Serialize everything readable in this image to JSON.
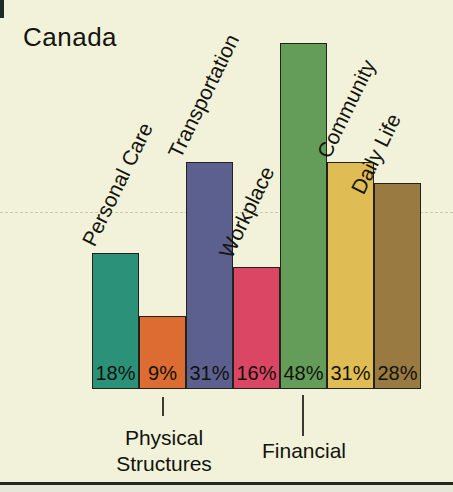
{
  "title": "Canada",
  "chart_data": {
    "type": "bar",
    "title": "Canada",
    "unit": "%",
    "categories": [
      "Personal Care",
      "Physical Structures",
      "Transportation",
      "Workplace",
      "Financial",
      "Community",
      "Daily Life"
    ],
    "values": [
      18,
      9,
      31,
      16,
      48,
      31,
      28
    ],
    "value_labels": [
      "18%",
      "9%",
      "31%",
      "16%",
      "48%",
      "31%",
      "28%"
    ],
    "colors": [
      "#2b9179",
      "#dc6c31",
      "#5b608f",
      "#da4663",
      "#649c59",
      "#e0bc55",
      "#997b41"
    ],
    "outline_color": "#22221c",
    "background_color": "#f1f2d9",
    "label_placement": [
      "rotated",
      "below",
      "rotated",
      "rotated",
      "below",
      "rotated",
      "rotated"
    ],
    "callouts": [
      {
        "category_index": 1,
        "lines": [
          "Physical",
          "Structures"
        ]
      },
      {
        "category_index": 4,
        "lines": [
          "Financial"
        ]
      }
    ],
    "ylim": [
      0,
      50
    ],
    "grid": "single faint dashed horizontal line near 25%",
    "legend": "none",
    "value_labels_position": "inside-bottom"
  }
}
